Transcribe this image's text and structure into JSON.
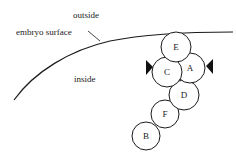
{
  "figure": {
    "type": "diagram",
    "width": 236,
    "height": 158,
    "background_color": "#ffffff",
    "line_color": "#1a1a1a",
    "title": ""
  },
  "annotations": {
    "outside_label": "outside",
    "inside_label": "inside",
    "surface_label": "embryo surface"
  },
  "surface": {
    "name": "embryo surface",
    "description": "curved boundary line separating outside (above) from inside (below)",
    "start_point": [
      14,
      100
    ],
    "end_point": [
      233,
      32
    ],
    "path": "M 14 100 C 34 72 70 50 110 41 C 150 33 196 32 233 32"
  },
  "leader": {
    "from": [
      88,
      31
    ],
    "to": [
      100,
      41
    ]
  },
  "cells": [
    {
      "id": "E",
      "label": "E",
      "cx": 176,
      "cy": 47,
      "r": 15
    },
    {
      "id": "A",
      "label": "A",
      "cx": 190,
      "cy": 68,
      "r": 15
    },
    {
      "id": "C",
      "label": "C",
      "cx": 167,
      "cy": 72,
      "r": 15
    },
    {
      "id": "D",
      "label": "D",
      "cx": 184,
      "cy": 95,
      "r": 15
    },
    {
      "id": "F",
      "label": "F",
      "cx": 165,
      "cy": 114,
      "r": 14
    },
    {
      "id": "B",
      "label": "B",
      "cx": 146,
      "cy": 136,
      "r": 14
    }
  ],
  "arrows": [
    {
      "name": "left-arrow",
      "direction": "right",
      "points_at": "C",
      "tip": [
        152,
        67
      ],
      "polygon": "146,60 146,75 153,67"
    },
    {
      "name": "right-arrow",
      "direction": "left",
      "points_at": "A",
      "tip": [
        206,
        66
      ],
      "polygon": "213,59 213,74 206,66"
    }
  ],
  "text_positions": {
    "outside": {
      "x": 73,
      "y": 18
    },
    "embryo_surface": {
      "x": 16,
      "y": 35
    },
    "inside": {
      "x": 74,
      "y": 82
    }
  }
}
